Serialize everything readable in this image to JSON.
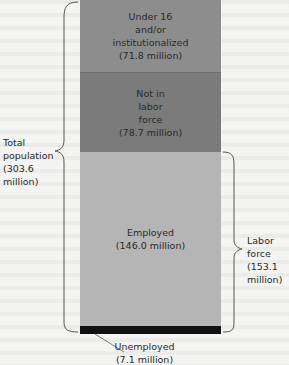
{
  "diagram": {
    "segments": [
      {
        "id": "under16",
        "lines": [
          "Under 16",
          "and/or",
          "institutionalized",
          "(71.8 million)"
        ],
        "value_millions": 71.8
      },
      {
        "id": "not_in_labor_force",
        "lines": [
          "Not in",
          "labor",
          "force",
          "(78.7 million)"
        ],
        "value_millions": 78.7
      },
      {
        "id": "employed",
        "lines": [
          "Employed",
          "(146.0 million)"
        ],
        "value_millions": 146.0
      },
      {
        "id": "unemployed",
        "lines": [
          "Unemployed",
          "(7.1 million)"
        ],
        "value_millions": 7.1
      }
    ],
    "total_population": {
      "lines": [
        "Total",
        "population",
        "(303.6",
        "million)"
      ],
      "value_millions": 303.6
    },
    "labor_force": {
      "lines": [
        "Labor",
        "force",
        "(153.1",
        "million)"
      ],
      "value_millions": 153.1
    },
    "colors": {
      "under16": "#8d8d8d",
      "not_in_labor_force": "#7b7b7b",
      "employed": "#b5b5b5",
      "unemployed": "#111111"
    }
  }
}
